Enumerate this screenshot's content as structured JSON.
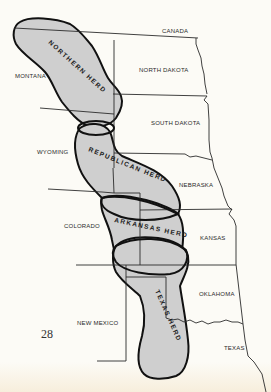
{
  "map": {
    "title": "Buffalo herds of the Great Plains",
    "page_number": "28",
    "colors": {
      "herd_fill": "#cfcfcf",
      "herd_outline": "#111111",
      "border": "#2b2b2b",
      "paper": "#fcfbf6"
    },
    "regions": {
      "canada": "CANADA",
      "montana": "MONTANA",
      "north_dakota": "NORTH DAKOTA",
      "south_dakota": "SOUTH DAKOTA",
      "wyoming": "WYOMING",
      "nebraska": "NEBRASKA",
      "colorado": "COLORADO",
      "kansas": "KANSAS",
      "oklahoma": "OKLAHOMA",
      "new_mexico": "NEW MEXICO",
      "texas": "TEXAS"
    },
    "herds": {
      "northern": "NORTHERN HERD",
      "republican": "REPUBLICAN HERD",
      "arkansas": "ARKANSAS HERD",
      "texas": "TEXAS HERD"
    }
  }
}
